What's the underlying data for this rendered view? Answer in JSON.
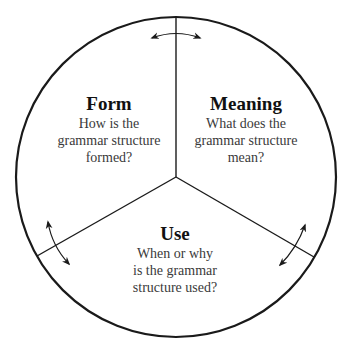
{
  "diagram": {
    "type": "pie-wheel",
    "colors": {
      "stroke": "#1a1a1a",
      "title": "#111111",
      "body": "#3a3a3a",
      "background": "#ffffff"
    },
    "sections": [
      {
        "id": "form",
        "title": "Form",
        "lines": [
          "How is the",
          "grammar structure",
          "formed?"
        ]
      },
      {
        "id": "meaning",
        "title": "Meaning",
        "lines": [
          "What does the",
          "grammar structure",
          "mean?"
        ]
      },
      {
        "id": "use",
        "title": "Use",
        "lines": [
          "When or why",
          "is the grammar",
          "structure used?"
        ]
      }
    ],
    "connectors": [
      {
        "between": [
          "form",
          "meaning"
        ],
        "icon": "double-arrow-icon"
      },
      {
        "between": [
          "form",
          "use"
        ],
        "icon": "double-arrow-icon"
      },
      {
        "between": [
          "meaning",
          "use"
        ],
        "icon": "double-arrow-icon"
      }
    ]
  }
}
